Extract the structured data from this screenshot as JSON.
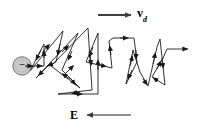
{
  "figure": {
    "background_color": "#ffffff",
    "width": 197,
    "height": 129,
    "labels": {
      "drift_velocity": "v",
      "drift_velocity_subscript": "d",
      "electric_field": "E",
      "charge_sign": "−"
    },
    "colors": {
      "path_stroke": "#1a1a1a",
      "arrow_stroke": "#4d4d4d",
      "electron_fill": "#c9c9c9",
      "electron_stroke": "#6e6e6e",
      "text": "#000000"
    },
    "elements": {
      "electron_label": "electron",
      "drift_arrow_direction": "right",
      "field_arrow_direction": "left",
      "exit_arrow_direction": "right",
      "path_description": "random zigzag scattering path"
    },
    "geometry": {
      "electron_circle": {
        "cx": 22,
        "cy": 66,
        "r": 9
      },
      "drift_arrow": {
        "x1": 98,
        "y1": 15,
        "x2": 133,
        "y2": 15
      },
      "field_arrow": {
        "x1": 131,
        "y1": 115,
        "x2": 85,
        "y2": 115
      },
      "exit_arrow": {
        "x1": 163,
        "y1": 51,
        "x2": 190,
        "y2": 51
      },
      "path_points": "33,66 44,66 44,44 30,71 63,31 56,62 48,66 36,78 78,33 62,70 80,88 51,66 88,28 92,90 58,94 98,94 98,33 86,62 112,68 109,41 113,38 134,38 137,62 126,84 133,50 140,72 148,86 157,47 160,39 165,85 152,77 163,58 167,49 163,51"
    }
  }
}
